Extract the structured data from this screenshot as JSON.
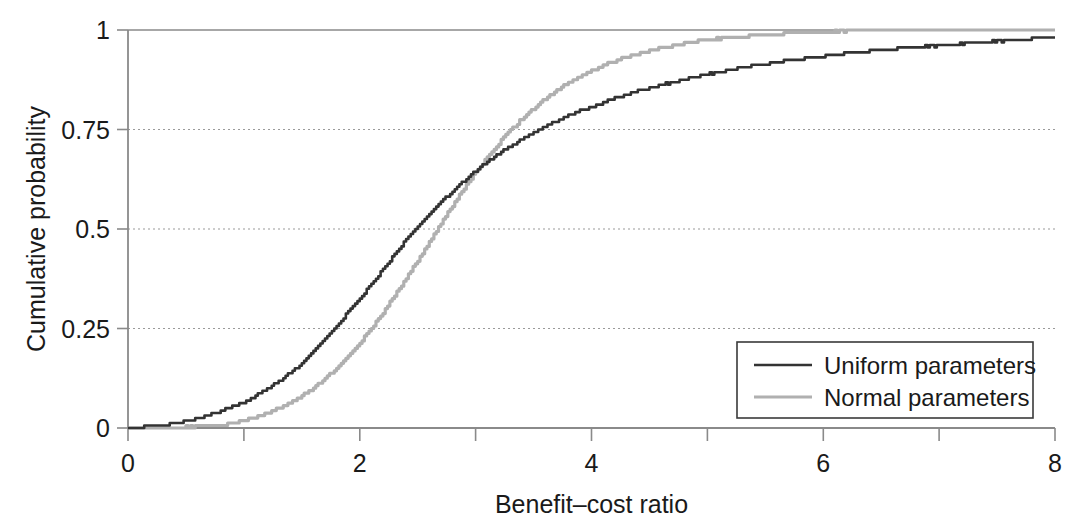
{
  "chart_data": {
    "type": "line",
    "title": "",
    "subtitle": "",
    "xlabel": "Benefit–cost ratio",
    "ylabel": "Cumulative probability",
    "xlim": [
      0,
      8
    ],
    "ylim": [
      0,
      1
    ],
    "xticks": [
      0,
      1,
      2,
      3,
      4,
      5,
      6,
      7,
      8
    ],
    "xtick_labels": [
      "0",
      "",
      "2",
      "",
      "4",
      "",
      "6",
      "",
      "8"
    ],
    "yticks": [
      0,
      0.25,
      0.5,
      0.75,
      1
    ],
    "ytick_labels": [
      "0",
      "0.25",
      "0.5",
      "0.75",
      "1"
    ],
    "grid": "horizontal-dotted",
    "legend_position": "lower-right",
    "annotations": [
      "Curves cross at approximately benefit-cost ratio 3.58, cumulative probability 0.75"
    ],
    "series": [
      {
        "name": "Uniform parameters",
        "color": "#333333",
        "x": [
          0.0,
          0.1,
          0.2,
          0.3,
          0.4,
          0.5,
          0.6,
          0.7,
          0.8,
          0.9,
          1.0,
          1.1,
          1.2,
          1.3,
          1.4,
          1.5,
          1.6,
          1.7,
          1.8,
          1.9,
          2.0,
          2.1,
          2.2,
          2.3,
          2.4,
          2.5,
          2.6,
          2.7,
          2.8,
          2.9,
          3.0,
          3.1,
          3.2,
          3.3,
          3.4,
          3.5,
          3.6,
          3.7,
          3.8,
          3.9,
          4.0,
          4.2,
          4.4,
          4.6,
          4.8,
          5.0,
          5.2,
          5.4,
          5.6,
          5.8,
          6.0,
          6.2,
          6.4,
          6.6,
          6.8,
          7.0,
          7.2,
          7.4,
          7.6,
          7.8,
          8.0
        ],
        "y": [
          0.0,
          0.001,
          0.003,
          0.006,
          0.01,
          0.016,
          0.023,
          0.031,
          0.041,
          0.052,
          0.065,
          0.08,
          0.097,
          0.116,
          0.137,
          0.16,
          0.19,
          0.222,
          0.256,
          0.29,
          0.325,
          0.36,
          0.398,
          0.436,
          0.472,
          0.505,
          0.537,
          0.567,
          0.594,
          0.62,
          0.645,
          0.668,
          0.689,
          0.708,
          0.726,
          0.742,
          0.757,
          0.771,
          0.784,
          0.796,
          0.807,
          0.827,
          0.845,
          0.861,
          0.875,
          0.888,
          0.899,
          0.909,
          0.918,
          0.926,
          0.933,
          0.94,
          0.946,
          0.951,
          0.956,
          0.96,
          0.965,
          0.969,
          0.973,
          0.977,
          0.981
        ]
      },
      {
        "name": "Normal parameters",
        "color": "#b0b0b0",
        "x": [
          0.0,
          0.2,
          0.4,
          0.5,
          0.6,
          0.7,
          0.8,
          0.9,
          1.0,
          1.1,
          1.2,
          1.3,
          1.4,
          1.5,
          1.6,
          1.7,
          1.8,
          1.9,
          2.0,
          2.1,
          2.2,
          2.3,
          2.4,
          2.5,
          2.6,
          2.7,
          2.8,
          2.9,
          3.0,
          3.1,
          3.2,
          3.3,
          3.4,
          3.5,
          3.6,
          3.7,
          3.8,
          3.9,
          4.0,
          4.2,
          4.4,
          4.6,
          4.8,
          5.0,
          5.2,
          5.4,
          5.6,
          5.8,
          6.0,
          6.2,
          6.4,
          6.6,
          6.8,
          7.0,
          7.1,
          7.5,
          8.0
        ],
        "y": [
          0.0,
          0.0,
          0.0,
          0.001,
          0.002,
          0.004,
          0.007,
          0.012,
          0.018,
          0.026,
          0.036,
          0.048,
          0.063,
          0.08,
          0.1,
          0.123,
          0.15,
          0.18,
          0.214,
          0.25,
          0.29,
          0.332,
          0.376,
          0.42,
          0.466,
          0.512,
          0.557,
          0.6,
          0.642,
          0.68,
          0.715,
          0.747,
          0.776,
          0.802,
          0.826,
          0.847,
          0.866,
          0.883,
          0.898,
          0.921,
          0.94,
          0.954,
          0.965,
          0.974,
          0.98,
          0.985,
          0.989,
          0.992,
          0.994,
          0.996,
          0.997,
          0.998,
          0.999,
          1.0,
          1.0,
          1.0,
          1.0
        ]
      }
    ]
  },
  "legend": {
    "items": [
      {
        "label": "Uniform parameters",
        "color": "#333333"
      },
      {
        "label": "Normal parameters",
        "color": "#b0b0b0"
      }
    ]
  },
  "axes": {
    "y_title": "Cumulative probability",
    "x_title": "Benefit–cost ratio",
    "y_tick_0": "0",
    "y_tick_025": "0.25",
    "y_tick_05": "0.5",
    "y_tick_075": "0.75",
    "y_tick_1": "1",
    "x_tick_0": "0",
    "x_tick_2": "2",
    "x_tick_4": "4",
    "x_tick_6": "6",
    "x_tick_8": "8"
  },
  "colors": {
    "axis": "#8a8a8a",
    "grid": "#9a9a9a",
    "text": "#1a1a1a",
    "uniform": "#333333",
    "normal": "#b0b0b0",
    "background": "#ffffff"
  }
}
